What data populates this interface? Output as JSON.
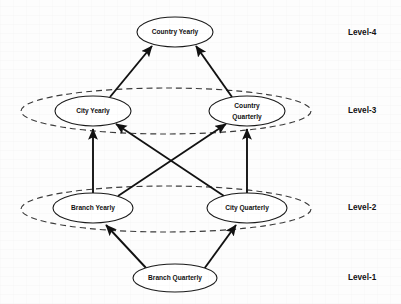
{
  "diagram": {
    "background_color": "#fdfdfd",
    "stroke_color": "#111111",
    "node_fill": "#ffffff",
    "group_stroke_color": "#3a3a3a",
    "nodes": [
      {
        "id": "country-yearly",
        "label": "Country Yearly",
        "label_line1": "Country Yearly",
        "label_line2": "",
        "level": 4,
        "cx": 175,
        "cy": 32,
        "rx": 38,
        "ry": 15
      },
      {
        "id": "city-yearly",
        "label": "City Yearly",
        "label_line1": "City Yearly",
        "label_line2": "",
        "level": 3,
        "cx": 93,
        "cy": 111,
        "rx": 38,
        "ry": 15
      },
      {
        "id": "country-quarterly",
        "label": "Country Quarterly",
        "label_line1": "Country",
        "label_line2": "Quarterly",
        "level": 3,
        "cx": 247,
        "cy": 111,
        "rx": 38,
        "ry": 15
      },
      {
        "id": "branch-yearly",
        "label": "Branch Yearly",
        "label_line1": "Branch Yearly",
        "label_line2": "",
        "level": 2,
        "cx": 93,
        "cy": 208,
        "rx": 40,
        "ry": 15
      },
      {
        "id": "city-quarterly",
        "label": "City Quarterly",
        "label_line1": "City Quarterly",
        "label_line2": "",
        "level": 2,
        "cx": 247,
        "cy": 208,
        "rx": 40,
        "ry": 15
      },
      {
        "id": "branch-quarterly",
        "label": "Branch Quarterly",
        "label_line1": "Branch Quarterly",
        "label_line2": "",
        "level": 1,
        "cx": 175,
        "cy": 278,
        "rx": 42,
        "ry": 14
      }
    ],
    "group_ellipses": [
      {
        "id": "level-3-group",
        "level": 3,
        "cx": 166,
        "cy": 111,
        "rx": 145,
        "ry": 23
      },
      {
        "id": "level-2-group",
        "level": 2,
        "cx": 166,
        "cy": 209,
        "rx": 145,
        "ry": 23
      }
    ],
    "edges": [
      {
        "id": "edge-city-yearly-to-country-yearly",
        "from": "city-yearly",
        "to": "country-yearly",
        "x1": 110,
        "y1": 97,
        "x2": 152,
        "y2": 46
      },
      {
        "id": "edge-country-quarterly-to-country-yearly",
        "from": "country-quarterly",
        "to": "country-yearly",
        "x1": 232,
        "y1": 97,
        "x2": 196,
        "y2": 46
      },
      {
        "id": "edge-branch-yearly-to-city-yearly",
        "from": "branch-yearly",
        "to": "city-yearly",
        "x1": 93,
        "y1": 193,
        "x2": 93,
        "y2": 127
      },
      {
        "id": "edge-city-quarterly-to-country-quarterly",
        "from": "city-quarterly",
        "to": "country-quarterly",
        "x1": 247,
        "y1": 193,
        "x2": 247,
        "y2": 127
      },
      {
        "id": "edge-branch-yearly-to-country-quarterly",
        "from": "branch-yearly",
        "to": "country-quarterly",
        "x1": 118,
        "y1": 196,
        "x2": 226,
        "y2": 124
      },
      {
        "id": "edge-city-quarterly-to-city-yearly",
        "from": "city-quarterly",
        "to": "city-yearly",
        "x1": 224,
        "y1": 196,
        "x2": 116,
        "y2": 124
      },
      {
        "id": "edge-branch-quarterly-to-branch-yearly",
        "from": "branch-quarterly",
        "to": "branch-yearly",
        "x1": 147,
        "y1": 269,
        "x2": 106,
        "y2": 224
      },
      {
        "id": "edge-branch-quarterly-to-city-quarterly",
        "from": "branch-quarterly",
        "to": "city-quarterly",
        "x1": 204,
        "y1": 269,
        "x2": 236,
        "y2": 224
      }
    ],
    "level_labels": [
      {
        "id": "level-4-label",
        "text": "Level-4",
        "x": 348,
        "y": 33
      },
      {
        "id": "level-3-label",
        "text": "Level-3",
        "x": 348,
        "y": 111
      },
      {
        "id": "level-2-label",
        "text": "Level-2",
        "x": 348,
        "y": 208
      },
      {
        "id": "level-1-label",
        "text": "Level-1",
        "x": 348,
        "y": 278
      }
    ]
  }
}
